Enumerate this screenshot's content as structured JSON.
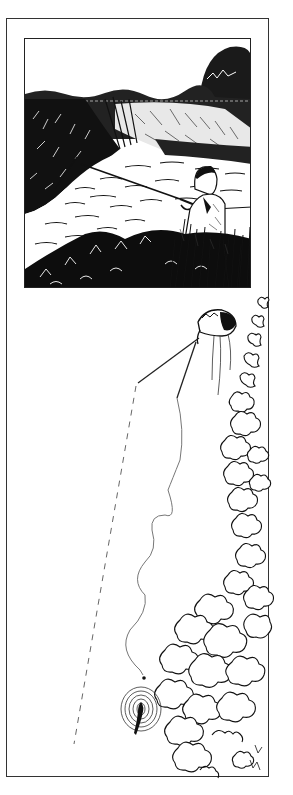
{
  "illustration": {
    "scene": {
      "description": "Pen-and-ink scene: angler seated in tall reeds on a riverbank, casting a rod over a winding stream bordered by bushes and trees",
      "colors": {
        "ink": "#111111",
        "paper": "#ffffff"
      }
    },
    "diagram": {
      "description": "Overhead diagram: angler on bank at top right, rod with straight line shown dashed toward bottom-left, slack wavy line ending at a fly landing near a rising fish with ripple rings, bankside bushes along the right edge",
      "elements": [
        "angler-figure",
        "rod",
        "dashed-line",
        "wavy-slack-line",
        "fly",
        "fish",
        "ripple-rings",
        "bankside-bushes"
      ],
      "colors": {
        "ink": "#111111",
        "line": "#555555"
      }
    }
  }
}
